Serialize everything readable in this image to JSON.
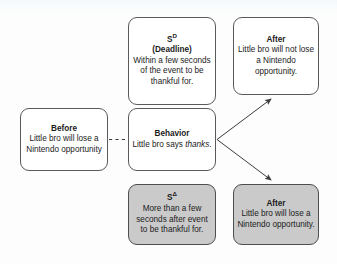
{
  "diagram": {
    "type": "contingency-diagram",
    "boxes": [
      {
        "id": "sd",
        "name": "sd-box",
        "title": "S",
        "title_superscript": "D",
        "subtitle": "(Deadline)",
        "body": "Within a few seconds of the event to be thankful for.",
        "shaded": false
      },
      {
        "id": "after_top",
        "name": "after-top-box",
        "title": "After",
        "body": "Little bro will not lose a Nintendo opportunity.",
        "shaded": false
      },
      {
        "id": "before",
        "name": "before-box",
        "title": "Before",
        "body": "Little bro will lose a Nintendo opportunity",
        "shaded": false
      },
      {
        "id": "behavior",
        "name": "behavior-box",
        "title": "Behavior",
        "body_pre": "Little bro says ",
        "body_em": "thanks",
        "body_post": ".",
        "shaded": false
      },
      {
        "id": "sdelta",
        "name": "s-delta-box",
        "title": "S",
        "title_superscript": "Δ",
        "body": "More than a few seconds after event to be thankful for.",
        "shaded": true
      },
      {
        "id": "after_bottom",
        "name": "after-bottom-box",
        "title": "After",
        "body": "Little bro will lose a Nintendo opportunity.",
        "shaded": true
      }
    ],
    "connectors": [
      {
        "name": "before-to-behavior-dashed",
        "style": "dashed",
        "arrow": false
      },
      {
        "name": "behavior-to-after-top-arrow",
        "style": "solid",
        "arrow": true
      },
      {
        "name": "behavior-to-after-bottom-arrow",
        "style": "solid",
        "arrow": true
      }
    ],
    "colors": {
      "box_fill": "#ffffff",
      "box_fill_shaded": "#cacaca",
      "box_border": "#5a5a5a",
      "line": "#3c3c3c",
      "text": "#1b1b1b",
      "background": "#fdfdfd"
    }
  }
}
